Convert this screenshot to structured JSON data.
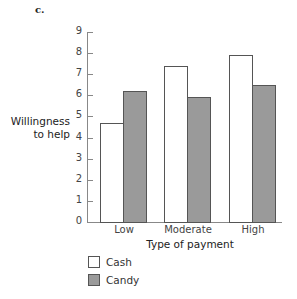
{
  "panel_label": "c.",
  "chart_data": {
    "type": "bar",
    "title": "",
    "xlabel": "Type of payment",
    "ylabel": "Willingness to help",
    "ylabel_lines": [
      "Willingness",
      "to help"
    ],
    "categories": [
      "Low",
      "Moderate",
      "High"
    ],
    "series": [
      {
        "name": "Cash",
        "color": "#ffffff",
        "values": [
          4.7,
          7.4,
          7.9
        ]
      },
      {
        "name": "Candy",
        "color": "#9a9a9a",
        "values": [
          6.2,
          5.9,
          6.5
        ]
      }
    ],
    "ylim": [
      0,
      9
    ],
    "yticks": [
      "0",
      "1",
      "2",
      "3",
      "4",
      "5",
      "6",
      "7",
      "8",
      "9"
    ],
    "grid": false,
    "legend_position": "bottom-left"
  },
  "legend": {
    "items": [
      {
        "label": "Cash"
      },
      {
        "label": "Candy"
      }
    ]
  }
}
